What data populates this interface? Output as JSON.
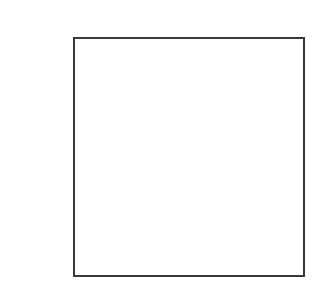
{
  "diagram": {
    "shapes": [
      {
        "type": "square-outline",
        "stroke_color": "#3a3a3a",
        "fill_color": "#ffffff"
      }
    ],
    "background_color": "#ffffff"
  }
}
